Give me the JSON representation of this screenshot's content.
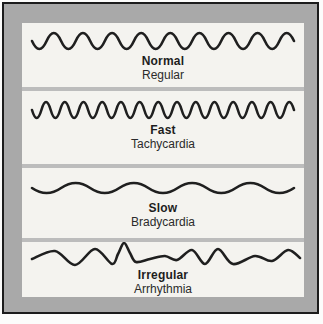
{
  "colors": {
    "frame_border": "#1c1c1c",
    "frame_mat": "#a9a9a9",
    "divider": "#bcbcbc",
    "panel_bg": "#f4f3ef",
    "wave_stroke": "#1f1f1f",
    "text": "#1d1d1d"
  },
  "panels": [
    {
      "label": "Normal",
      "sublabel": "Regular",
      "wave": {
        "type": "sine",
        "cycles": 9,
        "amplitude": 8,
        "height": 26
      }
    },
    {
      "label": "Fast",
      "sublabel": "Tachycardia",
      "wave": {
        "type": "sine",
        "cycles": 14,
        "amplitude": 8,
        "height": 26
      }
    },
    {
      "label": "Slow",
      "sublabel": "Bradycardia",
      "wave": {
        "type": "sine",
        "cycles": 4.5,
        "amplitude": 5,
        "height": 26
      }
    },
    {
      "label": "Irregular",
      "sublabel": "Arrhythmia",
      "wave": {
        "type": "points",
        "height": 28,
        "points": [
          [
            10,
            17
          ],
          [
            33,
            9
          ],
          [
            53,
            23
          ],
          [
            73,
            7
          ],
          [
            90,
            22
          ],
          [
            96,
            12
          ],
          [
            102,
            1
          ],
          [
            108,
            11
          ],
          [
            114,
            20
          ],
          [
            128,
            17
          ],
          [
            143,
            14
          ],
          [
            155,
            18
          ],
          [
            170,
            8
          ],
          [
            183,
            22
          ],
          [
            196,
            7
          ],
          [
            211,
            22
          ],
          [
            233,
            14
          ],
          [
            250,
            19
          ],
          [
            266,
            8
          ],
          [
            278,
            16
          ]
        ]
      }
    }
  ]
}
